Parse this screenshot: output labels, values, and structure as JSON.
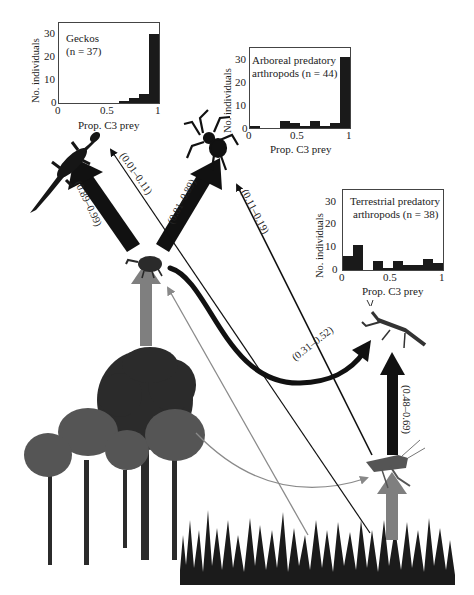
{
  "histograms": [
    {
      "id": "geckos",
      "title_line1": "Geckos",
      "title_line2": "(n = 37)",
      "ylabel": "No. individuals",
      "xlabel": "Prop. C3 prey",
      "yticks": [
        "30",
        "20",
        "10",
        "0"
      ],
      "xticks": [
        "0",
        "0.5",
        "1"
      ],
      "bins": [
        0,
        0,
        0,
        0,
        0,
        0,
        1,
        2,
        4,
        30
      ]
    },
    {
      "id": "arboreal",
      "title_line1": "Arboreal predatory",
      "title_line2": "arthropods (n = 44)",
      "ylabel": "No. individuals",
      "xlabel": "Prop. C3 prey",
      "yticks": [
        "30",
        "20",
        "10",
        "0"
      ],
      "xticks": [
        "0",
        "0.5",
        "1"
      ],
      "bins": [
        1,
        0,
        0,
        3,
        2,
        1,
        3,
        1,
        2,
        31
      ]
    },
    {
      "id": "terrestrial",
      "title_line1": "Terrestrial predatory",
      "title_line2": "arthropods (n = 38)",
      "ylabel": "No. individuals",
      "xlabel": "Prop. C3 prey",
      "yticks": [
        "30",
        "20",
        "10",
        "0"
      ],
      "xticks": [
        "0",
        "0.5",
        "1"
      ],
      "bins": [
        6,
        11,
        0,
        4,
        1,
        4,
        2,
        2,
        5,
        3
      ]
    }
  ],
  "flows": [
    {
      "from": "herbivorous-beetle",
      "to": "gecko",
      "label": "(0.89–0.99)",
      "weight": "heavy"
    },
    {
      "from": "grasshopper",
      "to": "gecko",
      "label": "(0.01–0.11)",
      "weight": "thin"
    },
    {
      "from": "herbivorous-beetle",
      "to": "spider",
      "label": "(0.81–0.89)",
      "weight": "heavy"
    },
    {
      "from": "grasshopper",
      "to": "spider",
      "label": "(0.11–0.19)",
      "weight": "thin"
    },
    {
      "from": "herbivorous-beetle",
      "to": "mantis",
      "label": "(0.31–0.52)",
      "weight": "medium"
    },
    {
      "from": "grasshopper",
      "to": "mantis",
      "label": "(0.48–0.69)",
      "weight": "heavy"
    },
    {
      "from": "trees",
      "to": "herbivorous-beetle",
      "label": "",
      "weight": "gray-heavy"
    },
    {
      "from": "grass",
      "to": "grasshopper",
      "label": "",
      "weight": "gray-heavy"
    },
    {
      "from": "grass",
      "to": "herbivorous-beetle",
      "label": "",
      "weight": "gray-thin"
    },
    {
      "from": "trees",
      "to": "grasshopper",
      "label": "",
      "weight": "gray-thin"
    }
  ],
  "organisms": [
    "gecko",
    "spider",
    "herbivorous-beetle",
    "mantis",
    "grasshopper",
    "trees",
    "grass"
  ],
  "colors": {
    "ink": "#111111",
    "gray_arrow": "#7a7a7a",
    "bar": "#1a1a1a"
  }
}
